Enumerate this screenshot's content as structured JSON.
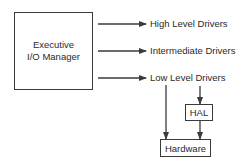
{
  "diagram": {
    "manager": {
      "line1": "Executive",
      "line2": "I/O Manager"
    },
    "driver_levels": [
      {
        "label": "High Level Drivers"
      },
      {
        "label": "Intermediate Drivers"
      },
      {
        "label": "Low Level Drivers"
      }
    ],
    "hal": {
      "label": "HAL"
    },
    "hardware": {
      "label": "Hardware"
    },
    "colors": {
      "line": "#3a3a3a",
      "text": "#2a2a2a",
      "background": "#ffffff"
    }
  }
}
